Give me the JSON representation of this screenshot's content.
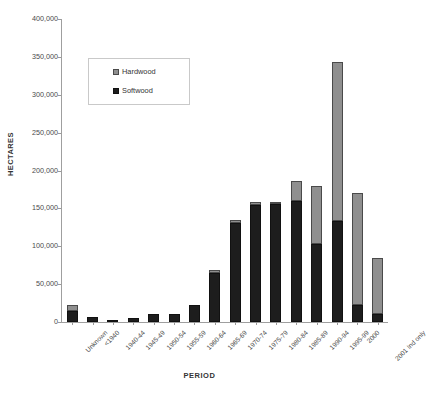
{
  "chart_data": {
    "type": "bar",
    "stacked": true,
    "title": "",
    "xlabel": "PERIOD",
    "ylabel": "HECTARES",
    "ylim": [
      0,
      400000
    ],
    "ytick_values": [
      0,
      50000,
      100000,
      150000,
      200000,
      250000,
      300000,
      350000,
      400000
    ],
    "ytick_labels": [
      "0",
      "50,000",
      "100,000",
      "150,000",
      "200,000",
      "250,000",
      "300,000",
      "350,000",
      "400,000"
    ],
    "grid": false,
    "legend_position": "upper-left-inside",
    "categories": [
      "Unknown",
      "<1940",
      "1940-44",
      "1945-49",
      "1950-54",
      "1955-59",
      "1960-64",
      "1965-69",
      "1970-74",
      "1975-79",
      "1980-84",
      "1985-89",
      "1990-94",
      "1995-99",
      "2000",
      "2001 Ind only"
    ],
    "series": [
      {
        "name": "Softwood",
        "color": "#1d1d1d",
        "values": [
          15000,
          7000,
          2500,
          5000,
          11000,
          10000,
          22000,
          65000,
          131000,
          155000,
          156000,
          160000,
          103000,
          133000,
          22000,
          10000
        ]
      },
      {
        "name": "Hardwood",
        "color": "#8f8f8f",
        "values": [
          7000,
          0,
          0,
          0,
          0,
          0,
          0,
          4000,
          4000,
          3000,
          3000,
          26000,
          77000,
          210000,
          148000,
          75000
        ]
      }
    ],
    "totals": [
      22000,
      7000,
      2500,
      5000,
      11000,
      10000,
      22000,
      69000,
      135000,
      158000,
      159000,
      186000,
      180000,
      343000,
      170000,
      85000
    ]
  },
  "legend": {
    "items": [
      {
        "label": "Hardwood",
        "swatch": "hardwood-swatch"
      },
      {
        "label": "Softwood",
        "swatch": "softwood-swatch"
      }
    ]
  }
}
